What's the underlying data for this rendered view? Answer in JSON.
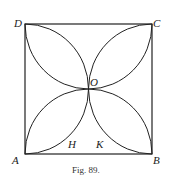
{
  "figure": {
    "caption": "Fig. 89.",
    "labels": {
      "A": "A",
      "B": "B",
      "C": "C",
      "D": "D",
      "O": "O",
      "H": "H",
      "K": "K"
    }
  }
}
